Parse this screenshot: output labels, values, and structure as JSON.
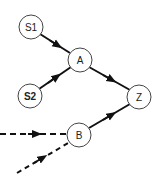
{
  "diagram": {
    "type": "directed-graph",
    "nodes": [
      {
        "id": "S1",
        "label": "S1",
        "x": 31,
        "y": 27
      },
      {
        "id": "S2",
        "label": "S2",
        "x": 30,
        "y": 96
      },
      {
        "id": "A",
        "label": "A",
        "x": 80,
        "y": 60
      },
      {
        "id": "Z",
        "label": "Z",
        "x": 139,
        "y": 97
      },
      {
        "id": "B",
        "label": "B",
        "x": 79,
        "y": 135
      }
    ],
    "edges": [
      {
        "from": "S1",
        "to": "A",
        "style": "solid"
      },
      {
        "from": "S2",
        "to": "A",
        "style": "solid"
      },
      {
        "from": "A",
        "to": "Z",
        "style": "solid"
      },
      {
        "from": "B",
        "to": "Z",
        "style": "solid"
      },
      {
        "from": "external-left",
        "to": "B",
        "style": "dashed"
      },
      {
        "from": "external-lower-left",
        "to": "B",
        "style": "dashed"
      }
    ]
  }
}
